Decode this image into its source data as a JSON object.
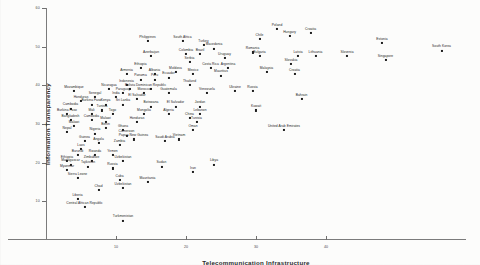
{
  "chart_data": {
    "type": "scatter",
    "title": "",
    "xlabel": "Telecommunication Infrastructure",
    "ylabel": "Information Transparency",
    "xlim": [
      0,
      60
    ],
    "ylim": [
      0,
      60
    ],
    "grid": false,
    "legend": "none",
    "xticks": [
      10,
      20,
      30,
      40
    ],
    "yticks": [
      10,
      20,
      30,
      40,
      50,
      60
    ],
    "point_count": 126,
    "points": [
      {
        "label": "Chile",
        "x": 30.5,
        "y": 52.0
      },
      {
        "label": "Croatia",
        "x": 37.8,
        "y": 53.5
      },
      {
        "label": "Poland",
        "x": 33.0,
        "y": 54.5
      },
      {
        "label": "Hungary",
        "x": 34.8,
        "y": 52.8
      },
      {
        "label": "Estonia",
        "x": 48.0,
        "y": 51.0
      },
      {
        "label": "South Korea",
        "x": 56.5,
        "y": 49.0
      },
      {
        "label": "Singapore",
        "x": 48.5,
        "y": 46.5
      },
      {
        "label": "Slovenia",
        "x": 43.0,
        "y": 47.5
      },
      {
        "label": "Lithuania",
        "x": 38.5,
        "y": 47.5
      },
      {
        "label": "Latvia",
        "x": 36.0,
        "y": 47.5
      },
      {
        "label": "Slovakia",
        "x": 35.0,
        "y": 45.5
      },
      {
        "label": "Croatia2",
        "x": 35.5,
        "y": 43.0
      },
      {
        "label": "Philippines",
        "x": 14.5,
        "y": 51.5
      },
      {
        "label": "South Africa",
        "x": 19.5,
        "y": 51.5
      },
      {
        "label": "Turkey",
        "x": 22.5,
        "y": 50.5
      },
      {
        "label": "Macedonia",
        "x": 24.0,
        "y": 49.5
      },
      {
        "label": "Romania",
        "x": 29.5,
        "y": 48.5
      },
      {
        "label": "Bulgaria",
        "x": 30.5,
        "y": 47.5
      },
      {
        "label": "Colombia",
        "x": 20.0,
        "y": 48.0
      },
      {
        "label": "Brazil",
        "x": 22.0,
        "y": 48.0
      },
      {
        "label": "Uruguay",
        "x": 25.5,
        "y": 47.0
      },
      {
        "label": "Serbia",
        "x": 20.5,
        "y": 46.0
      },
      {
        "label": "Costa Rica",
        "x": 23.5,
        "y": 44.5
      },
      {
        "label": "Argentina",
        "x": 26.0,
        "y": 44.5
      },
      {
        "label": "Mexico",
        "x": 21.0,
        "y": 43.0
      },
      {
        "label": "Mauritius",
        "x": 25.0,
        "y": 42.5
      },
      {
        "label": "Malaysia",
        "x": 31.5,
        "y": 43.5
      },
      {
        "label": "Azerbaijan",
        "x": 15.0,
        "y": 47.5
      },
      {
        "label": "Ethiopia",
        "x": 13.5,
        "y": 44.5
      },
      {
        "label": "Armenia",
        "x": 11.5,
        "y": 43.0
      },
      {
        "label": "Albania",
        "x": 15.5,
        "y": 43.0
      },
      {
        "label": "Moldova",
        "x": 18.5,
        "y": 43.5
      },
      {
        "label": "Ecuador",
        "x": 17.5,
        "y": 42.0
      },
      {
        "label": "Panama",
        "x": 13.5,
        "y": 41.5
      },
      {
        "label": "Peru",
        "x": 15.5,
        "y": 41.5
      },
      {
        "label": "Indonesia",
        "x": 11.5,
        "y": 40.0
      },
      {
        "label": "Thailand",
        "x": 20.5,
        "y": 40.0
      },
      {
        "label": "Nicaragua",
        "x": 9.0,
        "y": 39.0
      },
      {
        "label": "Bolivia",
        "x": 12.0,
        "y": 39.0
      },
      {
        "label": "Dominican Republic",
        "x": 15.0,
        "y": 39.0
      },
      {
        "label": "Paraguay",
        "x": 11.0,
        "y": 38.0
      },
      {
        "label": "Morocco",
        "x": 14.0,
        "y": 38.0
      },
      {
        "label": "Guatemala",
        "x": 17.5,
        "y": 38.0
      },
      {
        "label": "Venezuela",
        "x": 23.0,
        "y": 38.0
      },
      {
        "label": "Ukraine",
        "x": 27.0,
        "y": 38.5
      },
      {
        "label": "Russia",
        "x": 29.5,
        "y": 38.5
      },
      {
        "label": "Mozambique",
        "x": 4.0,
        "y": 38.5
      },
      {
        "label": "Senegal",
        "x": 7.0,
        "y": 37.0
      },
      {
        "label": "India",
        "x": 10.0,
        "y": 37.0
      },
      {
        "label": "El Salvador2",
        "x": 13.0,
        "y": 36.5
      },
      {
        "label": "Honduras",
        "x": 5.0,
        "y": 36.0
      },
      {
        "label": "Burkina Faso2",
        "x": 6.5,
        "y": 35.0
      },
      {
        "label": "Kenya",
        "x": 8.5,
        "y": 35.0
      },
      {
        "label": "Sri Lanka",
        "x": 11.0,
        "y": 35.0
      },
      {
        "label": "Botswana",
        "x": 15.0,
        "y": 34.5
      },
      {
        "label": "El Salvador",
        "x": 18.5,
        "y": 34.5
      },
      {
        "label": "Jordan",
        "x": 22.0,
        "y": 34.5
      },
      {
        "label": "Cambodia",
        "x": 3.5,
        "y": 34.0
      },
      {
        "label": "Tunisia2",
        "x": 8.0,
        "y": 33.5
      },
      {
        "label": "Lebanon",
        "x": 22.0,
        "y": 32.5
      },
      {
        "label": "Kuwait",
        "x": 30.0,
        "y": 33.5
      },
      {
        "label": "Bahrain",
        "x": 36.5,
        "y": 36.5
      },
      {
        "label": "Burkina Faso",
        "x": 3.0,
        "y": 32.5
      },
      {
        "label": "Mali",
        "x": 6.5,
        "y": 32.5
      },
      {
        "label": "Togo",
        "x": 9.5,
        "y": 32.5
      },
      {
        "label": "Mongolia",
        "x": 14.0,
        "y": 32.5
      },
      {
        "label": "Algeria",
        "x": 17.5,
        "y": 32.5
      },
      {
        "label": "China",
        "x": 20.5,
        "y": 31.5
      },
      {
        "label": "Tunisia",
        "x": 21.5,
        "y": 30.5
      },
      {
        "label": "Bangladesh",
        "x": 3.5,
        "y": 31.0
      },
      {
        "label": "Cambodia2",
        "x": 6.5,
        "y": 31.0
      },
      {
        "label": "Malawi",
        "x": 8.5,
        "y": 30.5
      },
      {
        "label": "Honduras2",
        "x": 13.0,
        "y": 30.5
      },
      {
        "label": "Malawi2",
        "x": 4.0,
        "y": 29.5
      },
      {
        "label": "Benin",
        "x": 8.5,
        "y": 29.0
      },
      {
        "label": "Ghana",
        "x": 11.0,
        "y": 28.5
      },
      {
        "label": "Oman",
        "x": 21.0,
        "y": 28.5
      },
      {
        "label": "United Arab Emirates",
        "x": 34.0,
        "y": 28.5
      },
      {
        "label": "Nepal",
        "x": 3.0,
        "y": 28.0
      },
      {
        "label": "Nigeria",
        "x": 7.0,
        "y": 27.5
      },
      {
        "label": "Cameroon",
        "x": 11.5,
        "y": 27.0
      },
      {
        "label": "Saudi Arabia",
        "x": 17.0,
        "y": 25.5
      },
      {
        "label": "Papua New Guinea",
        "x": 12.5,
        "y": 26.0
      },
      {
        "label": "Vietnam",
        "x": 19.0,
        "y": 26.0
      },
      {
        "label": "Guinea",
        "x": 5.5,
        "y": 25.5
      },
      {
        "label": "Angola",
        "x": 7.5,
        "y": 25.0
      },
      {
        "label": "Zambia",
        "x": 10.5,
        "y": 24.5
      },
      {
        "label": "Laos",
        "x": 5.0,
        "y": 23.5
      },
      {
        "label": "Burundi",
        "x": 4.5,
        "y": 22.0
      },
      {
        "label": "Rwanda",
        "x": 7.0,
        "y": 22.0
      },
      {
        "label": "Yemen",
        "x": 9.5,
        "y": 22.0
      },
      {
        "label": "Ethiopia2",
        "x": 3.0,
        "y": 20.5
      },
      {
        "label": "Zimbabwe",
        "x": 6.5,
        "y": 20.5
      },
      {
        "label": "Uzbekistan",
        "x": 11.0,
        "y": 20.5
      },
      {
        "label": "Madagascar",
        "x": 3.5,
        "y": 19.5
      },
      {
        "label": "Tajikistan",
        "x": 6.0,
        "y": 19.0
      },
      {
        "label": "Russia2",
        "x": 9.5,
        "y": 18.5
      },
      {
        "label": "Sudan",
        "x": 16.5,
        "y": 19.0
      },
      {
        "label": "Libya",
        "x": 24.0,
        "y": 19.5
      },
      {
        "label": "Myanmar",
        "x": 3.0,
        "y": 18.0
      },
      {
        "label": "Iran",
        "x": 21.0,
        "y": 17.5
      },
      {
        "label": "Sierra Leone",
        "x": 4.5,
        "y": 16.0
      },
      {
        "label": "Cuba",
        "x": 10.5,
        "y": 15.5
      },
      {
        "label": "Mauritania",
        "x": 14.5,
        "y": 15.0
      },
      {
        "label": "Uzbekistan2",
        "x": 11.0,
        "y": 13.5
      },
      {
        "label": "Chad",
        "x": 7.5,
        "y": 13.0
      },
      {
        "label": "Liberia",
        "x": 4.5,
        "y": 10.5
      },
      {
        "label": "Central African Republic",
        "x": 5.5,
        "y": 8.5
      },
      {
        "label": "Turkmenistan",
        "x": 11.0,
        "y": 5.0
      }
    ]
  }
}
